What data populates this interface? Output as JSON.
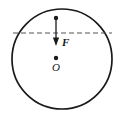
{
  "figure": {
    "kind": "physics-free-body-diagram",
    "caption": "",
    "labels": {
      "force": "F",
      "center": "O"
    },
    "colors": {
      "outline": "#1a1a1a",
      "dashed_line": "#555555",
      "arrow": "#1a1a1a",
      "background": "#ffffff",
      "caption": "#d8d8d8"
    },
    "geometry": {
      "circle": {
        "center_x": 62,
        "center_y": 59,
        "radius": 50,
        "stroke_width": 1.6
      },
      "dashed_chord": {
        "x1": 13,
        "x2": 112,
        "y": 33,
        "dash_pattern": "5,3",
        "stroke_width": 1.2
      },
      "force_arrow": {
        "x": 56,
        "y_start": 18,
        "y_end": 45,
        "direction": "down",
        "application_point_radius": 2.1,
        "head_width": 5,
        "head_length": 7
      },
      "center_point": {
        "x": 56,
        "y": 58,
        "radius": 2.1
      }
    }
  }
}
